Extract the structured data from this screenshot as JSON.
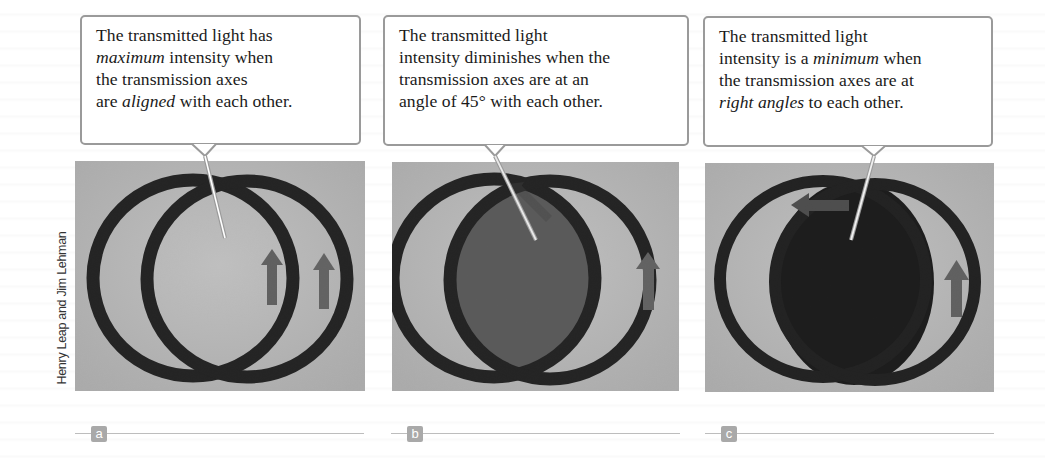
{
  "figure": {
    "credit": "Henry Leap and Jim Lehman",
    "colors": {
      "background_gray": "#b9b9b9",
      "ring": "#1e1e1e",
      "arrow": "#5e5e5e",
      "overlap_45": "#555555",
      "overlap_90": "#161616",
      "callout_border": "#9a9a9a",
      "badge": "#a9a9a9"
    },
    "panels": [
      {
        "label": "a",
        "callout": {
          "lines": [
            {
              "parts": [
                {
                  "text": "The transmitted light has",
                  "italic": false
                }
              ]
            },
            {
              "parts": [
                {
                  "text": "maximum",
                  "italic": true
                },
                {
                  "text": " intensity when",
                  "italic": false
                }
              ]
            },
            {
              "parts": [
                {
                  "text": "the transmission axes",
                  "italic": false
                }
              ]
            },
            {
              "parts": [
                {
                  "text": "are ",
                  "italic": false
                },
                {
                  "text": "aligned",
                  "italic": true
                },
                {
                  "text": " with each other.",
                  "italic": false
                }
              ]
            }
          ],
          "full_text": "The transmitted light has maximum intensity when the transmission axes are aligned with each other."
        },
        "angle_between_axes_deg": 0,
        "arrows": [
          "up-arrow",
          "up-arrow"
        ]
      },
      {
        "label": "b",
        "callout": {
          "lines": [
            {
              "parts": [
                {
                  "text": "The transmitted light",
                  "italic": false
                }
              ]
            },
            {
              "parts": [
                {
                  "text": "intensity diminishes when the",
                  "italic": false
                }
              ]
            },
            {
              "parts": [
                {
                  "text": "transmission axes are at an",
                  "italic": false
                }
              ]
            },
            {
              "parts": [
                {
                  "text": "angle of 45° with each other.",
                  "italic": false
                }
              ]
            }
          ],
          "full_text": "The transmitted light intensity diminishes when the transmission axes are at an angle of 45° with each other."
        },
        "angle_between_axes_deg": 45,
        "arrows": [
          "diagonal-arrow",
          "up-arrow"
        ]
      },
      {
        "label": "c",
        "callout": {
          "lines": [
            {
              "parts": [
                {
                  "text": "The transmitted light",
                  "italic": false
                }
              ]
            },
            {
              "parts": [
                {
                  "text": "intensity is a ",
                  "italic": false
                },
                {
                  "text": "minimum",
                  "italic": true
                },
                {
                  "text": " when",
                  "italic": false
                }
              ]
            },
            {
              "parts": [
                {
                  "text": "the transmission axes are at",
                  "italic": false
                }
              ]
            },
            {
              "parts": [
                {
                  "text": "right angles",
                  "italic": true
                },
                {
                  "text": " to each other.",
                  "italic": false
                }
              ]
            }
          ],
          "full_text": "The transmitted light intensity is a minimum when the transmission axes are at right angles to each other."
        },
        "angle_between_axes_deg": 90,
        "arrows": [
          "left-arrow",
          "up-arrow"
        ]
      }
    ]
  }
}
